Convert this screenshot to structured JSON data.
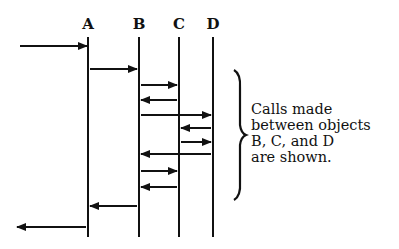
{
  "diagram": {
    "type": "sequence-diagram",
    "objects": [
      {
        "id": "A",
        "label": "A",
        "x": 88
      },
      {
        "id": "B",
        "label": "B",
        "x": 139
      },
      {
        "id": "C",
        "label": "C",
        "x": 179
      },
      {
        "id": "D",
        "label": "D",
        "x": 213
      }
    ],
    "lifeline_top": 37,
    "lifeline_bottom": 237,
    "messages": [
      {
        "from": "external",
        "to": "A",
        "y": 46
      },
      {
        "from": "A",
        "to": "B",
        "y": 69
      },
      {
        "from": "B",
        "to": "C",
        "y": 85
      },
      {
        "from": "C",
        "to": "B",
        "y": 100
      },
      {
        "from": "B",
        "to": "D",
        "y": 115
      },
      {
        "from": "D",
        "to": "C",
        "y": 128
      },
      {
        "from": "C",
        "to": "D",
        "y": 142
      },
      {
        "from": "D",
        "to": "B",
        "y": 154
      },
      {
        "from": "B",
        "to": "C",
        "y": 171
      },
      {
        "from": "C",
        "to": "B",
        "y": 187
      },
      {
        "from": "B",
        "to": "A",
        "y": 206
      },
      {
        "from": "A",
        "to": "external",
        "y": 227
      }
    ],
    "annotation": {
      "lines": [
        "Calls made",
        "between objects",
        "B, C, and D",
        "are shown."
      ],
      "brace_top": 70,
      "brace_bottom": 200
    },
    "colors": {
      "ink": "#111111",
      "background": "#ffffff"
    }
  }
}
